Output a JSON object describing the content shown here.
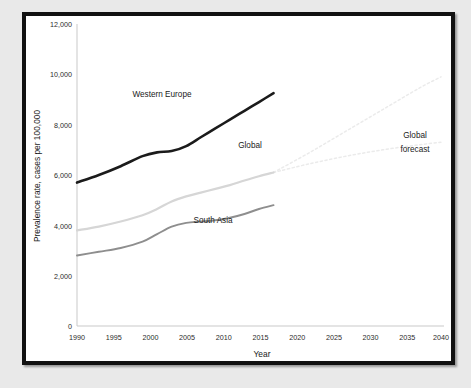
{
  "chart_data": {
    "type": "line",
    "title": "",
    "xlabel": "Year",
    "ylabel": "Prevalence rate, cases per 100,000",
    "xlim": [
      1990,
      2040
    ],
    "ylim": [
      0,
      12000
    ],
    "grid": false,
    "legend_position": "inline-annotations",
    "xticks": [
      "1990",
      "1995",
      "2000",
      "2005",
      "2010",
      "2015",
      "2020",
      "2025",
      "2030",
      "2035",
      "2040"
    ],
    "xtick_values": [
      1990,
      1995,
      2000,
      2005,
      2010,
      2015,
      2020,
      2025,
      2030,
      2035,
      2040
    ],
    "yticks": [
      "0",
      "2,000",
      "4,000",
      "6,000",
      "8,000",
      "10,000",
      "12,000"
    ],
    "ytick_values": [
      0,
      2000,
      4000,
      6000,
      8000,
      10000,
      12000
    ],
    "series": [
      {
        "name": "Western Europe",
        "color": "#1b1b1b",
        "style": "solid",
        "x": [
          1990,
          1993,
          1996,
          1999,
          2001,
          2003,
          2005,
          2007,
          2009,
          2011,
          2013,
          2015,
          2017
        ],
        "values": [
          5700,
          6000,
          6350,
          6750,
          6900,
          6950,
          7150,
          7500,
          7850,
          8200,
          8550,
          8900,
          9250
        ]
      },
      {
        "name": "Global",
        "color": "#d6d6d6",
        "style": "solid",
        "x": [
          1990,
          1993,
          1996,
          1999,
          2001,
          2003,
          2005,
          2007,
          2009,
          2011,
          2013,
          2015,
          2017
        ],
        "values": [
          3800,
          3950,
          4150,
          4400,
          4650,
          4950,
          5150,
          5300,
          5450,
          5600,
          5780,
          5950,
          6100
        ]
      },
      {
        "name": "South Asia",
        "color": "#8e8e8e",
        "style": "solid",
        "x": [
          1990,
          1993,
          1996,
          1999,
          2001,
          2003,
          2005,
          2007,
          2009,
          2011,
          2013,
          2015,
          2017
        ],
        "values": [
          2800,
          2950,
          3100,
          3350,
          3650,
          3950,
          4100,
          4150,
          4200,
          4300,
          4450,
          4650,
          4800
        ]
      },
      {
        "name": "Global forecast upper",
        "color": "#ebebeb",
        "style": "dotted",
        "x": [
          2017,
          2022,
          2027,
          2032,
          2037,
          2040
        ],
        "values": [
          6100,
          6900,
          7750,
          8600,
          9450,
          9900
        ]
      },
      {
        "name": "Global forecast lower",
        "color": "#ebebeb",
        "style": "dotted",
        "x": [
          2017,
          2022,
          2027,
          2032,
          2037,
          2040
        ],
        "values": [
          6100,
          6450,
          6750,
          7000,
          7200,
          7300
        ]
      }
    ],
    "annotations": [
      {
        "text": "Western Europe",
        "x": 1999,
        "y": 8450
      },
      {
        "text": "Global",
        "x": 2011,
        "y": 6450
      },
      {
        "text": "South Asia",
        "x": 2006,
        "y": 3500
      },
      {
        "text": "Global",
        "x": 2036,
        "y": 6850
      },
      {
        "text": "forecast",
        "x": 2036,
        "y": 6250
      }
    ]
  },
  "labels": {
    "y_axis_title": "Prevalence rate, cases per 100,000",
    "x_axis_title": "Year",
    "western_europe": "Western Europe",
    "global": "Global",
    "south_asia": "South Asia",
    "global_forecast_line1": "Global",
    "global_forecast_line2": "forecast",
    "y_0": "0",
    "y_2000": "2,000",
    "y_4000": "4,000",
    "y_6000": "6,000",
    "y_8000": "8,000",
    "y_10000": "10,000",
    "y_12000": "12,000",
    "x_1990": "1990",
    "x_1995": "1995",
    "x_2000": "2000",
    "x_2005": "2005",
    "x_2010": "2010",
    "x_2015": "2015",
    "x_2020": "2020",
    "x_2025": "2025",
    "x_2030": "2030",
    "x_2035": "2035",
    "x_2040": "2040"
  }
}
